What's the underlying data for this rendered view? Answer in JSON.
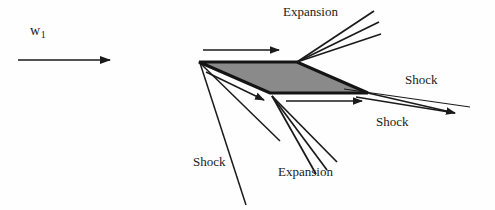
{
  "figure": {
    "type": "supersonic-flow-diagram",
    "background_color": "#fefefe",
    "line_color": "#1a1a1a",
    "airfoil_fill_color": "#8a8a8a",
    "airfoil_stroke_color": "#141414",
    "text_color": "#1a1a1a"
  },
  "labels": {
    "freestream_symbol": "w",
    "freestream_subscript": "1",
    "expansion_top": "Expansion",
    "expansion_bottom": "Expansion",
    "shock_lower_left": "Shock",
    "shock_upper_right": "Shock",
    "shock_lower_right": "Shock"
  },
  "geometry": {
    "airfoil": {
      "leading_edge": [
        199,
        62
      ],
      "upper_apex": [
        297,
        62
      ],
      "trailing_edge": [
        368,
        93
      ],
      "lower_apex": [
        270,
        93
      ],
      "description": "diamond wedge cross-section"
    },
    "freestream_arrow": {
      "x1": 18,
      "y1": 60,
      "x2": 112,
      "y2": 60
    },
    "upper_surface_arrow": {
      "x1": 203,
      "y1": 50,
      "x2": 281,
      "y2": 50
    },
    "leading_edge_turn_arrow": {
      "x1": 206,
      "y1": 72,
      "x2": 266,
      "y2": 101
    },
    "lower_surface_arrow": {
      "x1": 286,
      "y1": 101,
      "x2": 364,
      "y2": 101
    },
    "upper_expansion_fan_origin": [
      297,
      62
    ],
    "upper_expansion_fan_ends": [
      [
        374,
        11
      ],
      [
        379,
        22
      ],
      [
        381,
        33
      ]
    ],
    "lower_expansion_fan_origin": [
      272,
      96
    ],
    "lower_expansion_fan_ends": [
      [
        316,
        174
      ],
      [
        327,
        170
      ],
      [
        337,
        163
      ]
    ],
    "leading_edge_shock_ends": [
      [
        246,
        205
      ],
      [
        352,
        110
      ]
    ],
    "trailing_edge_shock_origin": [
      368,
      93
    ],
    "trailing_edge_shock_ends": [
      [
        465,
        116
      ],
      [
        463,
        111
      ]
    ],
    "trailing_shock_upper_line": {
      "x1": 345,
      "y1": 90,
      "x2": 470,
      "y2": 108
    }
  },
  "label_positions": {
    "freestream": [
      30,
      30
    ],
    "expansion_top": [
      283,
      6
    ],
    "expansion_bottom": [
      278,
      165
    ],
    "shock_lower_left": [
      193,
      155
    ],
    "shock_upper_right": [
      405,
      73
    ],
    "shock_lower_right": [
      376,
      115
    ]
  }
}
